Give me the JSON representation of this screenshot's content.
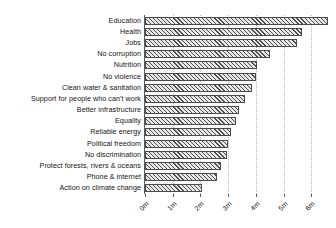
{
  "chart_data": {
    "type": "bar",
    "orientation": "horizontal",
    "title": "",
    "subtitle": "",
    "xlabel": "",
    "ylabel": "",
    "xlim": [
      0,
      6.6
    ],
    "grid": true,
    "legend": null,
    "xticks": [
      "0m",
      "1m",
      "2m",
      "3m",
      "4m",
      "5m",
      "6m"
    ],
    "xtick_values": [
      0,
      1,
      2,
      3,
      4,
      5,
      6
    ],
    "units": "millions of votes",
    "categories": [
      "Education",
      "Health",
      "Jobs",
      "No corruption",
      "Nutrition",
      "No violence",
      "Clean water & sanitation",
      "Support for people who can't work",
      "Better infrastructure",
      "Equality",
      "Reliable energy",
      "Political freedom",
      "No discrimination",
      "Protect forests, rivers & oceans",
      "Phone & internet",
      "Action on climate change"
    ],
    "values": [
      6.6,
      5.65,
      5.5,
      4.5,
      4.05,
      4.0,
      3.85,
      3.6,
      3.38,
      3.3,
      3.1,
      3.0,
      2.95,
      2.75,
      2.6,
      2.05
    ],
    "bar_style": {
      "fill": "diagonal-hatch",
      "edge_color": "#4a4a4a",
      "face_color": "#d4d4d4"
    }
  }
}
